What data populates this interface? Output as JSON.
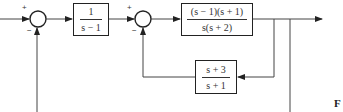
{
  "diagram": {
    "type": "block-diagram",
    "summing_junctions": [
      {
        "id": "sum1",
        "plus_sign": "+",
        "minus_sign": "−"
      },
      {
        "id": "sum2",
        "plus_sign": "+",
        "minus_sign": "−"
      }
    ],
    "blocks": {
      "g1": {
        "numerator": "1",
        "denominator": "s − 1"
      },
      "g2": {
        "numerator": "(s − 1)(s + 1)",
        "denominator": "s(s + 2)"
      },
      "h1": {
        "numerator": "s + 3",
        "denominator": "s + 1"
      }
    },
    "caption": "F"
  }
}
